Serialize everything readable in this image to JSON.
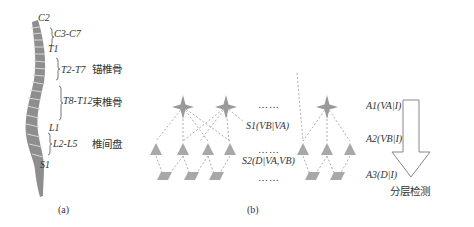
{
  "panel_a": {
    "caption": "(a)",
    "vertebra_labels": {
      "c2": "C2",
      "c3_c7": "C3-C7",
      "t1": "T1",
      "t2_t7": "T2-T7",
      "t8_t12": "T8-T12",
      "l1": "L1",
      "l2_l5": "L2-L5",
      "s1": "S1"
    },
    "groups": {
      "anchor": "锚椎骨",
      "bundle": "束椎骨",
      "disc": "椎间盘"
    }
  },
  "panel_b": {
    "caption": "(b)",
    "layers": {
      "a1": "A1(VA|I)",
      "a2": "A2(VB|I)",
      "a3": "A3(D|I)"
    },
    "relations": {
      "s1": "S1(VB|VA)",
      "s2": "S2(D|VA,VB)"
    },
    "ellipsis": "……",
    "arrow_label": "分层检测"
  },
  "colors": {
    "shape_fill": "#a8a8a8",
    "spine": "#8a8a8a",
    "dash": "#888888"
  }
}
